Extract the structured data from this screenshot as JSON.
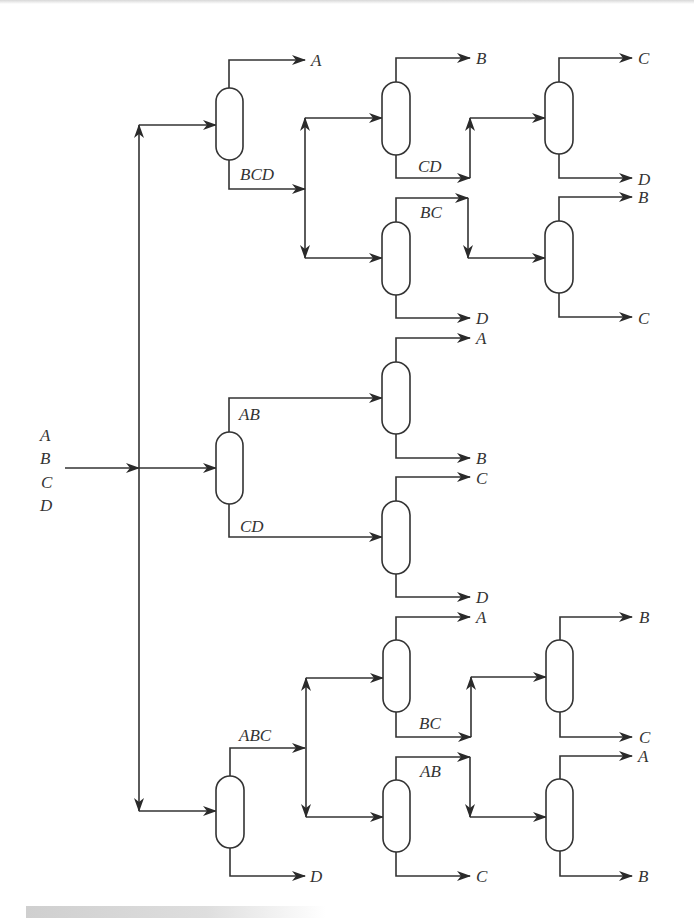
{
  "diagram": {
    "title": "",
    "type": "distillation-sequence-superstructure",
    "feed": {
      "components": [
        "A",
        "B",
        "C",
        "D"
      ]
    },
    "columns": [
      {
        "id": "c1",
        "feed": "ABCD",
        "top": "A",
        "bottom": "BCD"
      },
      {
        "id": "c2",
        "feed": "BCD",
        "top": "B",
        "bottom": "CD"
      },
      {
        "id": "c3",
        "feed": "CD",
        "top": "C",
        "bottom": "D"
      },
      {
        "id": "c4",
        "feed": "BCD",
        "top": "BC",
        "bottom": "D"
      },
      {
        "id": "c5",
        "feed": "BC",
        "top": "B",
        "bottom": "C"
      },
      {
        "id": "c6",
        "feed": "ABCD",
        "top": "AB",
        "bottom": "CD"
      },
      {
        "id": "c7",
        "feed": "AB",
        "top": "A",
        "bottom": "B"
      },
      {
        "id": "c8",
        "feed": "CD",
        "top": "C",
        "bottom": "D"
      },
      {
        "id": "c9",
        "feed": "ABCD",
        "top": "ABC",
        "bottom": "D"
      },
      {
        "id": "c10",
        "feed": "ABC",
        "top": "A",
        "bottom": "BC"
      },
      {
        "id": "c11",
        "feed": "BC",
        "top": "B",
        "bottom": "C"
      },
      {
        "id": "c12",
        "feed": "ABC",
        "top": "AB",
        "bottom": "C"
      },
      {
        "id": "c13",
        "feed": "AB",
        "top": "A",
        "bottom": "B"
      }
    ],
    "labels": {
      "feed_a": "A",
      "feed_b": "B",
      "feed_c": "C",
      "feed_d": "D",
      "c1_top": "A",
      "c1_bottom": "BCD",
      "c2_top": "B",
      "c2_bottom": "CD",
      "c3_top": "C",
      "c3_bottom": "D",
      "c4_top": "BC",
      "c4_bottom": "D",
      "c5_top": "B",
      "c5_bottom": "C",
      "c6_top": "AB",
      "c6_bottom": "CD",
      "c7_top": "A",
      "c7_bottom": "B",
      "c8_top": "C",
      "c8_bottom": "D",
      "c9_top": "ABC",
      "c9_bottom": "D",
      "c10_top": "A",
      "c10_bottom": "BC",
      "c11_top": "B",
      "c11_bottom": "C",
      "c12_top": "AB",
      "c12_bottom": "C",
      "c13_top": "A",
      "c13_bottom": "B"
    },
    "colors": {
      "line": "#333333",
      "background": "#ffffff"
    }
  }
}
